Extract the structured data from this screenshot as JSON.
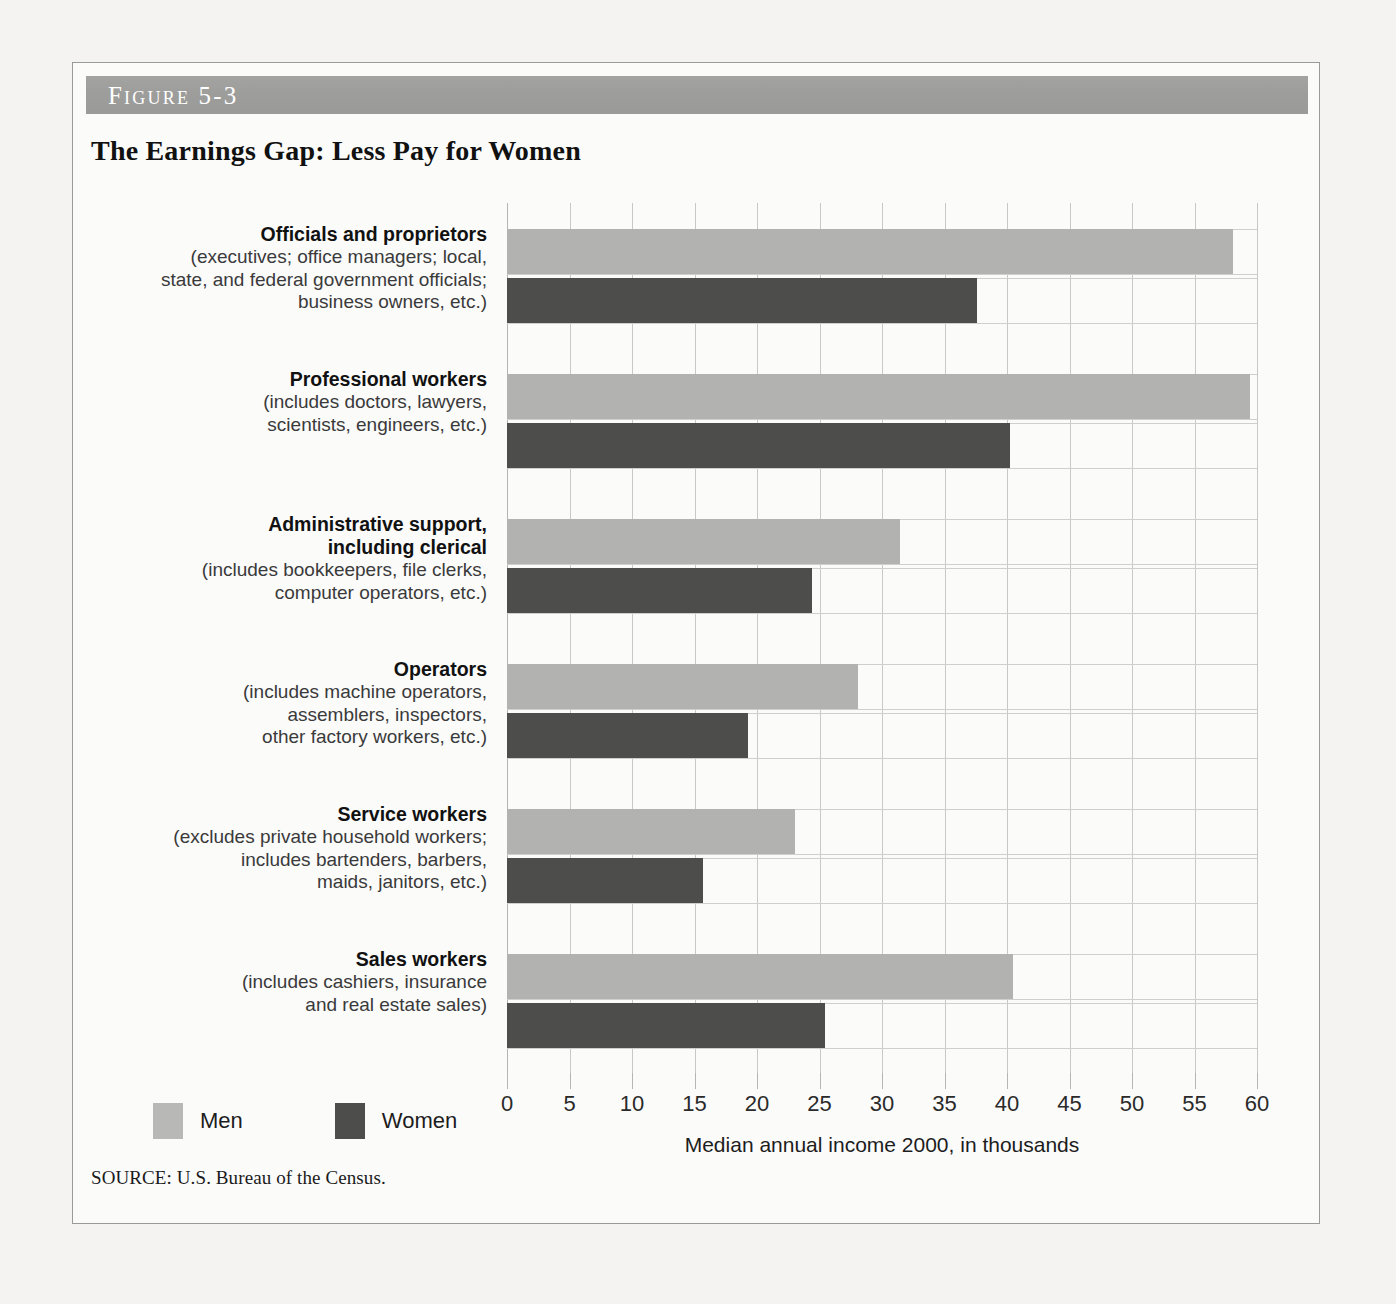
{
  "figure": {
    "label": "Figure 5-3",
    "title": "The Earnings Gap: Less Pay for Women",
    "source": "SOURCE: U.S. Bureau of the Census."
  },
  "legend": {
    "men_label": "Men",
    "women_label": "Women",
    "men_color": "#b2b2b0",
    "women_color": "#4d4d4c"
  },
  "axis": {
    "title": "Median annual income 2000, in thousands",
    "ticks": [
      "0",
      "5",
      "10",
      "15",
      "20",
      "25",
      "30",
      "35",
      "40",
      "45",
      "50",
      "55",
      "60"
    ]
  },
  "categories": [
    {
      "name": "Officials and proprietors",
      "desc": "(executives; office managers; local,\nstate, and federal government officials;\nbusiness owners, etc.)"
    },
    {
      "name": "Professional workers",
      "desc": "(includes doctors, lawyers,\nscientists, engineers, etc.)"
    },
    {
      "name": "Administrative support,\nincluding clerical",
      "desc": "(includes bookkeepers, file clerks,\ncomputer operators, etc.)"
    },
    {
      "name": "Operators",
      "desc": "(includes machine operators,\nassemblers, inspectors,\nother factory workers, etc.)"
    },
    {
      "name": "Service workers",
      "desc": "(excludes private household workers;\nincludes bartenders, barbers,\nmaids, janitors, etc.)"
    },
    {
      "name": "Sales workers",
      "desc": "(includes cashiers, insurance\nand real estate sales)"
    }
  ],
  "chart_data": {
    "type": "bar",
    "orientation": "horizontal",
    "title": "The Earnings Gap: Less Pay for Women",
    "xlabel": "Median annual income 2000, in thousands",
    "ylabel": "",
    "xlim": [
      0,
      60
    ],
    "xticks": [
      0,
      5,
      10,
      15,
      20,
      25,
      30,
      35,
      40,
      45,
      50,
      55,
      60
    ],
    "grid": true,
    "legend_position": "bottom-left",
    "categories": [
      "Officials and proprietors",
      "Professional workers",
      "Administrative support, including clerical",
      "Operators",
      "Service workers",
      "Sales workers"
    ],
    "series": [
      {
        "name": "Men",
        "color": "#b2b2b0",
        "values": [
          58.1,
          59.4,
          31.4,
          28.1,
          23.0,
          40.5
        ]
      },
      {
        "name": "Women",
        "color": "#4d4d4c",
        "values": [
          37.6,
          40.2,
          24.4,
          19.3,
          15.7,
          25.4
        ]
      }
    ]
  }
}
